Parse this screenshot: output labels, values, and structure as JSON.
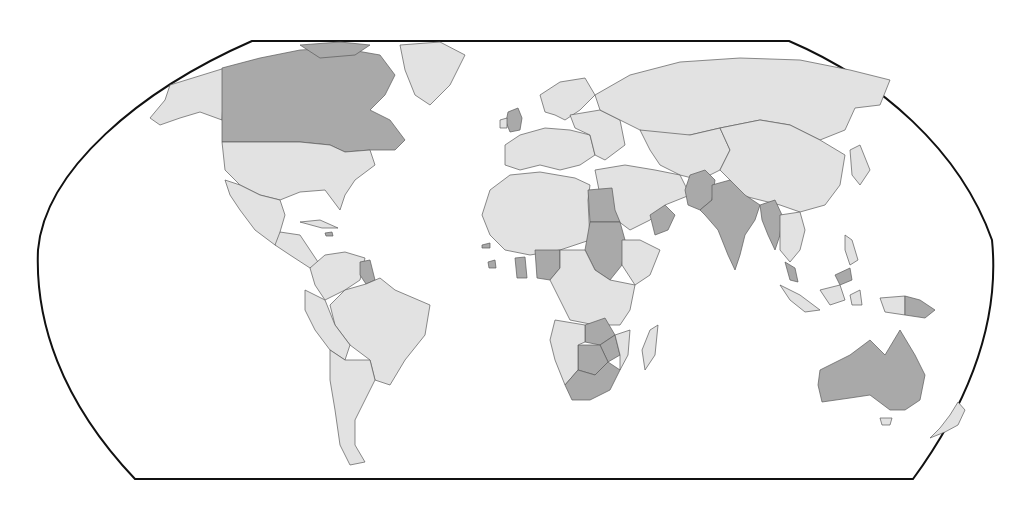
{
  "map": {
    "projection": "robinson",
    "colors": {
      "background": "#ffffff",
      "land_default": "#e2e2e2",
      "land_highlighted": "#a9a9a9",
      "border": "#5a5a5a",
      "frame": "#111111"
    },
    "highlighted_countries": [
      "Canada",
      "United Kingdom",
      "Guyana",
      "Jamaica",
      "Gambia",
      "Sierra Leone",
      "Ghana",
      "Nigeria",
      "Egypt",
      "Sudan",
      "Oman",
      "Pakistan",
      "India",
      "Bangladesh",
      "Myanmar",
      "Malaysia",
      "Zambia",
      "Zimbabwe",
      "Botswana",
      "South Africa",
      "Australia",
      "Papua New Guinea"
    ],
    "labels": []
  }
}
